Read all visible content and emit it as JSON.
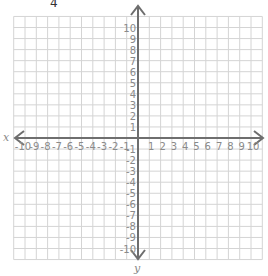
{
  "header": {
    "cropped_text": "4"
  },
  "plane": {
    "x_axis_label": "x",
    "y_axis_label": "y",
    "x_min": -10,
    "x_max": 10,
    "y_min": -10,
    "y_max": 10,
    "x_tick_labels": [
      "-10",
      "-9",
      "-8",
      "-7",
      "-6",
      "-5",
      "-4",
      "-3",
      "-2",
      "-1",
      "1",
      "2",
      "3",
      "4",
      "5",
      "6",
      "7",
      "8",
      "9",
      "10"
    ],
    "y_tick_labels": [
      "10",
      "9",
      "8",
      "7",
      "6",
      "5",
      "4",
      "3",
      "2",
      "1",
      "-1",
      "-2",
      "-3",
      "-4",
      "-5",
      "-6",
      "-7",
      "-8",
      "-9",
      "-10"
    ],
    "colors": {
      "grid": "#d4d4d4",
      "axis": "#6e6e6e",
      "label": "#8a8a8a"
    }
  }
}
